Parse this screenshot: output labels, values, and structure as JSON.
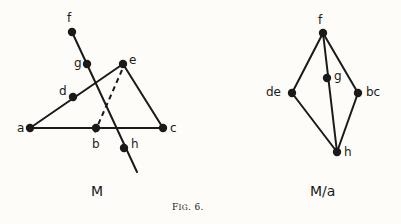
{
  "figure": {
    "caption_prefix": "F",
    "caption_rest": "IG",
    "caption_suffix": ". 6.",
    "caption_full": "Fig. 6.",
    "background_color": "#fdfcf8",
    "ink_color": "#1a1a1a"
  },
  "diagrams": [
    {
      "id": "matroid-m",
      "title": "M",
      "title_pos": {
        "x": 91,
        "y": 184
      },
      "points": [
        {
          "name": "f",
          "x": 72,
          "y": 32,
          "label": "f",
          "lx": 67,
          "ly": 12
        },
        {
          "name": "g",
          "x": 87,
          "y": 64,
          "label": "g",
          "lx": 74,
          "ly": 57
        },
        {
          "name": "e",
          "x": 123,
          "y": 64,
          "label": "e",
          "lx": 129,
          "ly": 54
        },
        {
          "name": "d",
          "x": 73,
          "y": 97,
          "label": "d",
          "lx": 59,
          "ly": 85
        },
        {
          "name": "a",
          "x": 30,
          "y": 128,
          "label": "a",
          "lx": 17,
          "ly": 122
        },
        {
          "name": "b",
          "x": 96,
          "y": 128,
          "label": "b",
          "lx": 92,
          "ly": 138
        },
        {
          "name": "c",
          "x": 163,
          "y": 128,
          "label": "c",
          "lx": 170,
          "ly": 122
        },
        {
          "name": "h",
          "x": 124,
          "y": 148,
          "label": "h",
          "lx": 131,
          "ly": 138
        }
      ],
      "solid_lines": [
        {
          "name": "line-f-h",
          "x1": 72,
          "y1": 32,
          "x2": 137,
          "y2": 172
        },
        {
          "name": "line-a-d-e",
          "x1": 30,
          "y1": 128,
          "x2": 123,
          "y2": 64
        },
        {
          "name": "line-a-b-c",
          "x1": 30,
          "y1": 128,
          "x2": 163,
          "y2": 128
        },
        {
          "name": "line-e-c",
          "x1": 123,
          "y1": 64,
          "x2": 163,
          "y2": 128
        }
      ],
      "dashed_lines": [
        {
          "name": "line-e-b-dashed",
          "x1": 122,
          "y1": 70,
          "x2": 94,
          "y2": 134
        }
      ]
    },
    {
      "id": "matroid-m-contract-a",
      "title": "M/a",
      "title_pos": {
        "x": 310,
        "y": 184
      },
      "points": [
        {
          "name": "f",
          "x": 323,
          "y": 33,
          "label": "f",
          "lx": 318,
          "ly": 14
        },
        {
          "name": "g",
          "x": 327,
          "y": 78,
          "label": "g",
          "lx": 334,
          "ly": 70
        },
        {
          "name": "de",
          "x": 292,
          "y": 93,
          "label": "de",
          "lx": 266,
          "ly": 86
        },
        {
          "name": "bc",
          "x": 358,
          "y": 93,
          "label": "bc",
          "lx": 366,
          "ly": 86
        },
        {
          "name": "h",
          "x": 337,
          "y": 152,
          "label": "h",
          "lx": 344,
          "ly": 146
        }
      ],
      "solid_lines": [
        {
          "name": "line-f-de",
          "x1": 323,
          "y1": 33,
          "x2": 292,
          "y2": 93
        },
        {
          "name": "line-f-bc",
          "x1": 323,
          "y1": 33,
          "x2": 358,
          "y2": 93
        },
        {
          "name": "line-f-g-h",
          "x1": 323,
          "y1": 33,
          "x2": 337,
          "y2": 152
        },
        {
          "name": "line-de-h",
          "x1": 292,
          "y1": 93,
          "x2": 337,
          "y2": 152
        },
        {
          "name": "line-bc-h",
          "x1": 358,
          "y1": 93,
          "x2": 337,
          "y2": 152
        }
      ],
      "dashed_lines": []
    }
  ],
  "caption_pos": {
    "x": 172,
    "y": 203
  }
}
